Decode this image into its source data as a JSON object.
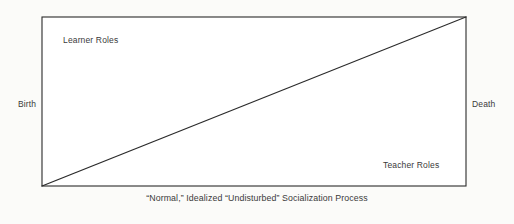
{
  "figure": {
    "caption": "“Normal,” Idealized “Undisturbed” Socialization Process",
    "labels": {
      "top_left": "Learner Roles",
      "bottom_right": "Teacher Roles",
      "left_axis": "Birth",
      "right_axis": "Death"
    },
    "colors": {
      "background": "#fbfbf9",
      "plot_fill": "#ffffff",
      "stroke": "#2b2b2b",
      "text": "#3a3a3a"
    },
    "geometry": {
      "frame": {
        "x": 42,
        "y": 17,
        "width": 424,
        "height": 169
      },
      "diagonal": {
        "x1": 42,
        "y1": 186,
        "x2": 466,
        "y2": 17
      },
      "stroke_width": 1.1
    }
  }
}
